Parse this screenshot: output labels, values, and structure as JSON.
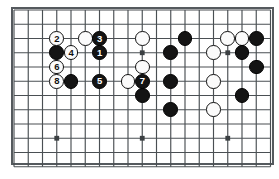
{
  "diagram": {
    "type": "go-board-diagram",
    "board": {
      "columns": 18,
      "rows": 11,
      "line_color": "#4a4f53",
      "border_color": "#555a5e",
      "background_color": "#ffffff",
      "origin_x": 14,
      "origin_y": 10,
      "cell_size": 14.25,
      "star_points": [
        {
          "col": 3,
          "row": 9
        },
        {
          "col": 9,
          "row": 9
        },
        {
          "col": 15,
          "row": 9
        },
        {
          "col": 9,
          "row": 3
        },
        {
          "col": 15,
          "row": 3
        }
      ]
    },
    "colors": {
      "black_stone": "#141414",
      "white_stone": "#fbfbfb",
      "black_label": "#ffffff",
      "white_label": "#111111"
    },
    "move_sequence": [
      {
        "number": "1",
        "color": "black"
      },
      {
        "number": "2",
        "color": "white"
      },
      {
        "number": "3",
        "color": "black"
      },
      {
        "number": "4",
        "color": "white"
      },
      {
        "number": "5",
        "color": "black"
      },
      {
        "number": "6",
        "color": "white"
      },
      {
        "number": "7",
        "color": "black"
      },
      {
        "number": "8",
        "color": "white"
      }
    ],
    "stones": [
      {
        "col": 3,
        "row": 2,
        "color": "white",
        "label": "2"
      },
      {
        "col": 5,
        "row": 2,
        "color": "white",
        "label": ""
      },
      {
        "col": 6,
        "row": 2,
        "color": "black",
        "label": "3"
      },
      {
        "col": 9,
        "row": 2,
        "color": "white",
        "label": ""
      },
      {
        "col": 12,
        "row": 2,
        "color": "black",
        "label": ""
      },
      {
        "col": 15,
        "row": 2,
        "color": "white",
        "label": ""
      },
      {
        "col": 16,
        "row": 2,
        "color": "white",
        "label": ""
      },
      {
        "col": 17,
        "row": 2,
        "color": "black",
        "label": ""
      },
      {
        "col": 3,
        "row": 3,
        "color": "black",
        "label": ""
      },
      {
        "col": 4,
        "row": 3,
        "color": "white",
        "label": "4"
      },
      {
        "col": 6,
        "row": 3,
        "color": "black",
        "label": "1"
      },
      {
        "col": 11,
        "row": 3,
        "color": "black",
        "label": ""
      },
      {
        "col": 14,
        "row": 3,
        "color": "white",
        "label": ""
      },
      {
        "col": 16,
        "row": 3,
        "color": "black",
        "label": ""
      },
      {
        "col": 3,
        "row": 4,
        "color": "white",
        "label": "6"
      },
      {
        "col": 9,
        "row": 4,
        "color": "white",
        "label": ""
      },
      {
        "col": 17,
        "row": 4,
        "color": "black",
        "label": ""
      },
      {
        "col": 3,
        "row": 5,
        "color": "white",
        "label": "8"
      },
      {
        "col": 4,
        "row": 5,
        "color": "black",
        "label": ""
      },
      {
        "col": 6,
        "row": 5,
        "color": "black",
        "label": "5"
      },
      {
        "col": 8,
        "row": 5,
        "color": "white",
        "label": ""
      },
      {
        "col": 9,
        "row": 5,
        "color": "black",
        "label": "7"
      },
      {
        "col": 11,
        "row": 5,
        "color": "black",
        "label": ""
      },
      {
        "col": 14,
        "row": 5,
        "color": "white",
        "label": ""
      },
      {
        "col": 9,
        "row": 6,
        "color": "black",
        "label": ""
      },
      {
        "col": 16,
        "row": 6,
        "color": "black",
        "label": ""
      },
      {
        "col": 11,
        "row": 7,
        "color": "black",
        "label": ""
      },
      {
        "col": 14,
        "row": 7,
        "color": "white",
        "label": ""
      }
    ]
  }
}
